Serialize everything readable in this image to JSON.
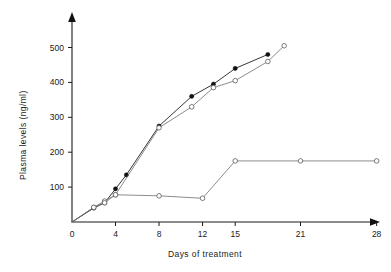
{
  "chart_data": {
    "type": "line",
    "title": "",
    "xlabel": "Days of treatment",
    "ylabel": "Plasma levels (ng/ml)",
    "xlim": [
      0,
      30
    ],
    "ylim": [
      0,
      550
    ],
    "grid": false,
    "legend": "none",
    "x_ticks": [
      0,
      4,
      8,
      12,
      15,
      21,
      28
    ],
    "x_tick_labels": [
      "0",
      "4",
      "8",
      "12",
      "15",
      "21",
      "28"
    ],
    "y_ticks": [
      100,
      200,
      300,
      400,
      500
    ],
    "y_tick_labels": [
      "100",
      "200",
      "300",
      "400",
      "500"
    ],
    "series": [
      {
        "name": "series-filled-rising",
        "marker": "filled-circle",
        "x": [
          0,
          2,
          3,
          4,
          5,
          8,
          11,
          13,
          15,
          18
        ],
        "values": [
          0,
          40,
          55,
          95,
          135,
          275,
          360,
          395,
          440,
          480
        ]
      },
      {
        "name": "series-open-rising",
        "marker": "open-circle",
        "x": [
          0,
          2,
          3,
          4,
          8,
          11,
          13,
          15,
          18,
          19.5
        ],
        "values": [
          0,
          42,
          60,
          78,
          270,
          330,
          385,
          405,
          460,
          505
        ]
      },
      {
        "name": "series-open-plateau",
        "marker": "open-circle",
        "x": [
          0,
          2,
          3,
          4,
          8,
          12,
          15,
          21,
          28
        ],
        "values": [
          0,
          42,
          55,
          78,
          75,
          68,
          175,
          175,
          175
        ]
      }
    ]
  },
  "axes": {
    "x_axis_name": "x-axis",
    "y_axis_name": "y-axis"
  }
}
